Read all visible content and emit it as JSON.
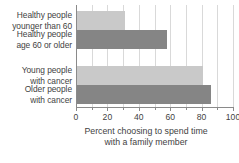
{
  "chart_data": {
    "type": "bar",
    "orientation": "horizontal",
    "title": "",
    "xlabel_line1": "Percent choosing to spend time",
    "xlabel_line2": "with a family member",
    "ylabel": "",
    "xlim": [
      0,
      100
    ],
    "grid": true,
    "legend": "none",
    "categories": [
      "Healthy people younger than 60",
      "Healthy people age 60 or older",
      "Young people with cancer",
      "Older people with cancer"
    ],
    "category_lines": [
      {
        "line1": "Healthy people",
        "line2": "younger than 60"
      },
      {
        "line1": "Healthy people",
        "line2": "age 60 or older"
      },
      {
        "line1": "Young people",
        "line2": "with cancer"
      },
      {
        "line1": "Older people",
        "line2": "with cancer"
      }
    ],
    "values": [
      31,
      58,
      81,
      86
    ],
    "bar_colors": [
      "#c9c9c9",
      "#858585",
      "#c9c9c9",
      "#858585"
    ],
    "xticks": [
      0,
      20,
      40,
      60,
      80,
      100
    ],
    "xtick_labels": [
      "0",
      "20",
      "40",
      "60",
      "80",
      "100"
    ],
    "xminor_ticks": [
      10,
      30,
      50,
      70,
      90
    ],
    "gridlines": [
      10,
      20,
      30,
      40,
      50,
      60,
      70,
      80,
      90,
      100
    ]
  },
  "colors": {
    "light_bar": "#c9c9c9",
    "dark_bar": "#858585",
    "gridline": "#d9d9d9",
    "axis": "#8a8a8a",
    "text": "#3f3f3f",
    "background": "#ffffff"
  }
}
